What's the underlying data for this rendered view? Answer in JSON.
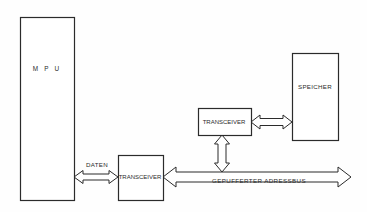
{
  "diagram": {
    "title_visible": false,
    "canvas": {
      "width": 367,
      "height": 212,
      "background": "#fefefe"
    },
    "stroke_color": "#2b2b2b",
    "text_color": "#2b2b2b",
    "blocks": [
      {
        "id": "mpu",
        "label": "M P U",
        "x": 20,
        "y": 17,
        "w": 54,
        "h": 183,
        "label_x": 47,
        "label_y": 71,
        "letter_spacing": 2.2,
        "font_size": 6.4
      },
      {
        "id": "transceiver-data",
        "label": "TRANSCEIVER",
        "x": 118,
        "y": 155,
        "w": 45,
        "h": 45,
        "label_x": 140,
        "label_y": 179,
        "letter_spacing": 0,
        "font_size": 6.0
      },
      {
        "id": "transceiver-address",
        "label": "TRANSCEIVER",
        "x": 198,
        "y": 108,
        "w": 53,
        "h": 27,
        "label_x": 224,
        "label_y": 124,
        "letter_spacing": 0,
        "font_size": 6.0
      },
      {
        "id": "speicher",
        "label": "SPEICHER",
        "x": 292,
        "y": 53,
        "w": 46,
        "h": 87,
        "label_x": 315,
        "label_y": 89,
        "letter_spacing": 0.3,
        "font_size": 6.2
      }
    ],
    "labels": [
      {
        "id": "daten",
        "text": "DATEN",
        "x": 97,
        "y": 167,
        "font_size": 6.2,
        "letter_spacing": 0.3
      },
      {
        "id": "gepufferter-adressbus",
        "text": "GEPUFFERTER ADRESSBUS",
        "x": 259,
        "y": 183,
        "font_size": 6.2,
        "letter_spacing": 0.4
      }
    ],
    "arrows": [
      {
        "id": "arrow-mpu-transceiver-data",
        "orientation": "horizontal",
        "from": "mpu",
        "to": "transceiver-data",
        "x1": 74,
        "x2": 118,
        "y": 177,
        "half_thickness": 3.0,
        "head_len": 9,
        "head_half": 6.5
      },
      {
        "id": "arrow-address-bus",
        "orientation": "horizontal",
        "from": "transceiver-data",
        "to": "bus-end",
        "x1": 163,
        "x2": 351,
        "y": 177,
        "half_thickness": 5.0,
        "head_len": 13,
        "head_half": 10.0
      },
      {
        "id": "arrow-transceiver-address-to-bus",
        "orientation": "vertical",
        "from": "transceiver-address",
        "to": "arrow-address-bus",
        "x": 222,
        "y1": 135,
        "y2": 172,
        "half_thickness": 4.0,
        "head_len": 9,
        "head_half": 7.5
      },
      {
        "id": "arrow-transceiver-address-speicher",
        "orientation": "horizontal",
        "from": "transceiver-address",
        "to": "speicher",
        "x1": 251,
        "x2": 292,
        "y": 122,
        "half_thickness": 3.5,
        "head_len": 9,
        "head_half": 7.0
      }
    ]
  }
}
